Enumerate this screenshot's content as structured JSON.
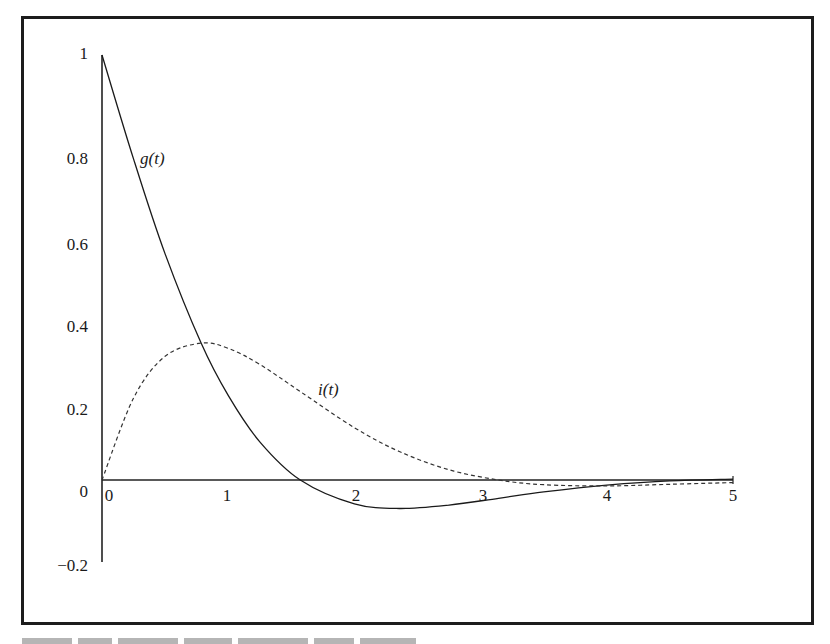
{
  "chart_data": {
    "type": "line",
    "title": "",
    "xlabel": "",
    "ylabel": "",
    "xlim": [
      0,
      5
    ],
    "ylim": [
      -0.2,
      1
    ],
    "grid": false,
    "legend": "none (curves labeled inline)",
    "x_ticks": [
      "0",
      "1",
      "2",
      "3",
      "4",
      "5"
    ],
    "y_ticks": [
      "1",
      "0.8",
      "0.6",
      "0.4",
      "0.2",
      "0",
      "-0.2"
    ],
    "x": [
      0,
      0.25,
      0.5,
      0.785,
      1.0,
      1.25,
      1.571,
      2.0,
      2.356,
      2.75,
      3.142,
      3.5,
      4.0,
      4.5,
      5.0
    ],
    "series": [
      {
        "name": "g(t)",
        "style": "solid",
        "values": [
          1.0,
          0.755,
          0.532,
          0.322,
          0.199,
          0.09,
          0.0,
          -0.056,
          -0.067,
          -0.059,
          -0.043,
          -0.028,
          -0.012,
          -0.002,
          0.002
        ]
      },
      {
        "name": "i(t)",
        "style": "dashed",
        "values": [
          0.0,
          0.193,
          0.291,
          0.322,
          0.31,
          0.272,
          0.208,
          0.123,
          0.067,
          0.024,
          0.0,
          -0.011,
          -0.014,
          -0.01,
          -0.006
        ]
      }
    ],
    "annotations": [
      {
        "text": "g(t)",
        "x": 0.35,
        "y": 0.8
      },
      {
        "text": "i(t)",
        "x": 1.85,
        "y": 0.2
      }
    ]
  },
  "labels": {
    "y": [
      "1",
      "0.8",
      "0.6",
      "0.4",
      "0.2",
      "0",
      "−0.2"
    ],
    "x": [
      "0",
      "1",
      "2",
      "3",
      "4",
      "5"
    ],
    "g": "g(t)",
    "i": "i(t)"
  }
}
